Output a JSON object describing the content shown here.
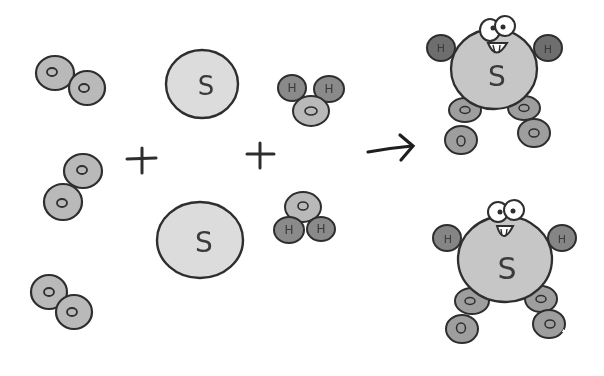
{
  "diagram": {
    "type": "chemical-reaction-cartoon",
    "colors": {
      "background": "#ffffff",
      "outline": "#2e2e2e",
      "oxygen_fill": "#b9b9b9",
      "sulfur_fill": "#dcdcdc",
      "hydrogen_fill": "#8a8a8a",
      "product_body_fill": "#c4c4c4"
    },
    "operators": {
      "plus": "+",
      "arrow": "→"
    },
    "reactants": {
      "oxygen_molecules": [
        {
          "atoms": [
            "O",
            "O"
          ]
        },
        {
          "atoms": [
            "O",
            "O"
          ]
        },
        {
          "atoms": [
            "O",
            "O"
          ]
        }
      ],
      "sulfur_atoms": [
        {
          "label": "S"
        },
        {
          "label": "S"
        }
      ],
      "water_molecules": [
        {
          "atoms": [
            "H",
            "H",
            "O"
          ]
        },
        {
          "atoms": [
            "O",
            "H",
            "H"
          ]
        }
      ]
    },
    "products": [
      {
        "body": "S",
        "arms": [
          "H",
          "H"
        ],
        "legs": [
          "O",
          "O",
          "O",
          "O"
        ],
        "face": "smiling"
      },
      {
        "body": "S",
        "arms": [
          "H",
          "H"
        ],
        "legs": [
          "O",
          "O",
          "O",
          "O"
        ],
        "face": "smiling"
      }
    ]
  }
}
